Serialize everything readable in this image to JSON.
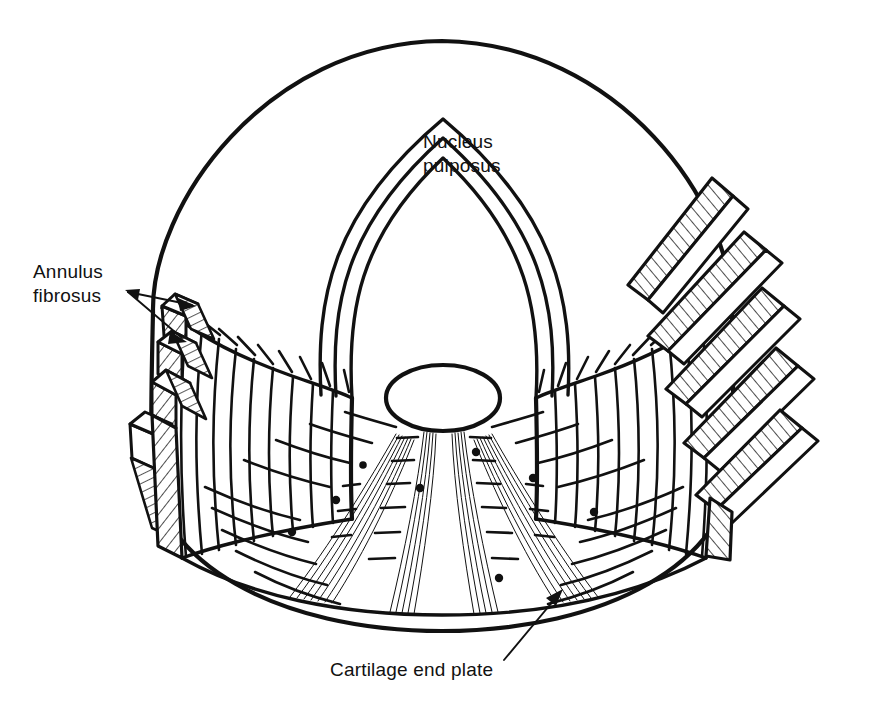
{
  "figure": {
    "kind": "anatomical-line-diagram",
    "background_color": "#ffffff",
    "ink_color": "#111111",
    "width": 884,
    "height": 708
  },
  "labels": {
    "nucleus": {
      "line1": "Nucleus",
      "line2": "pulposus",
      "has_leader": false
    },
    "annulus": {
      "line1": "Annulus",
      "line2": "fibrosus",
      "has_leader": true,
      "leader_arrow_count": 2
    },
    "endplate": {
      "line1": "Cartilage end plate",
      "has_leader": true,
      "leader_arrow_count": 1
    }
  },
  "structures": [
    {
      "name": "top-annular-surface",
      "description": "elliptical superior disc surface"
    },
    {
      "name": "nucleus-pulposus-horseshoe",
      "description": "U-shaped nucleus boundary with three concentric contour lines"
    },
    {
      "name": "annulus-fibrosus-left-lamellae",
      "description": "stepped obliquely hatched lamellar bands, left cut edge"
    },
    {
      "name": "annulus-fibrosus-right-lamellae",
      "description": "stepped obliquely hatched lamellar bands, right cut edge"
    },
    {
      "name": "cut-face-left",
      "description": "vertical fibre lines on left cut wall"
    },
    {
      "name": "cut-face-right",
      "description": "vertical fibre lines on right cut wall"
    },
    {
      "name": "cartilage-end-plate-floor",
      "description": "inferior end plate with radial dashes, dots and fan fibre bundles"
    },
    {
      "name": "nucleus-base-ellipse",
      "description": "small ellipse where nucleus meets the end plate"
    }
  ],
  "counts": {
    "nucleus_contour_lines": 3,
    "left_lamellae_steps": 4,
    "right_lamellae_steps": 5,
    "endplate_fan_bundles": 4,
    "endplate_dots": 8
  }
}
